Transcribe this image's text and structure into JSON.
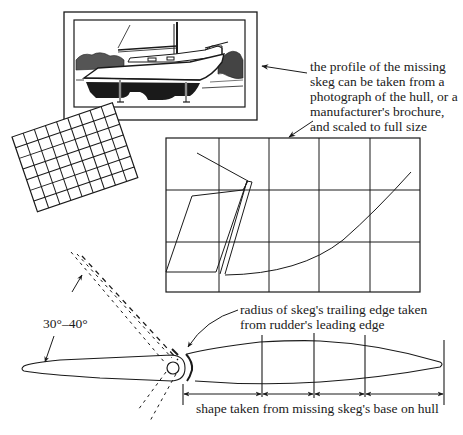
{
  "figure": {
    "annotations": {
      "profile_note": [
        "the profile of the missing",
        "skeg can be taken from a",
        "photograph of the hull, or a",
        "manufacturer's brochure,",
        "and scaled to full size"
      ],
      "angle_range": "30°–40°",
      "radius_note": [
        "radius of skeg's trailing edge taken",
        "from rudder's leading edge"
      ],
      "shape_note": "shape taken from missing skeg's base on hull"
    },
    "elements": {
      "photo": "photograph of sailboat hull on stands",
      "small_grid": {
        "columns": 9,
        "rows": 7,
        "rotation_deg": -19
      },
      "large_grid": {
        "columns": 5,
        "rows": 3
      },
      "rudder_section": "rudder foil with pivot",
      "rudder_deflected": "dashed rudder outline swung 30-40 degrees",
      "skeg_section": "skeg foil with concave trailing edge matching rudder radius",
      "dimension_stations": 4
    },
    "colors": {
      "ink": "#1a1a1a",
      "background": "#ffffff"
    }
  }
}
